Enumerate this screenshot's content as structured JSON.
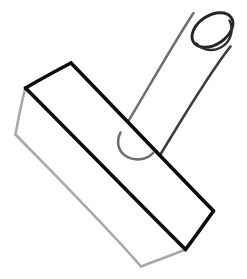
{
  "image": {
    "title": "Line drawing of a stamp-like 3D object",
    "subject": "rectangular prism with attached cylindrical handle",
    "style": "hand-drawn outline sketch",
    "width": 247,
    "height": 279,
    "background_color": "#ffffff"
  },
  "palette": {
    "background": "#ffffff",
    "stroke_black": "#0b0b0b",
    "stroke_dark_gray": "#434343",
    "stroke_mid_gray": "#6f6f6f",
    "stroke_light_gray": "#a8a8a8",
    "fill_white": "#ffffff"
  },
  "strokes": {
    "box_front_width": 3.6,
    "box_back_width": 2.6,
    "handle_width": 2.6,
    "handle_rim_width": 2.8
  },
  "geometry": {
    "box": {
      "name": "rectangular-prism",
      "top_face": {
        "points": "71,63 25,88 185,249 213,211",
        "description": "top visible face of the prism"
      },
      "front_edges": [
        {
          "name": "top-left-short-edge",
          "from": "71,63",
          "to": "25,88",
          "tone": "black"
        },
        {
          "name": "top-long-edge",
          "from": "71,63",
          "to": "213,211",
          "tone": "black"
        },
        {
          "name": "right-short-edge",
          "from": "213,211",
          "to": "185,249",
          "tone": "black"
        },
        {
          "name": "bottom-long-edge",
          "from": "25,88",
          "to": "185,249",
          "tone": "black"
        }
      ],
      "back_edges": [
        {
          "name": "left-vertical-edge",
          "from": "25,88",
          "to": "15,134",
          "tone": "light-gray"
        },
        {
          "name": "bottom-left-long-edge",
          "from": "15,134",
          "to": "141,266",
          "tone": "light-gray"
        },
        {
          "name": "bottom-short-edge",
          "from": "141,266",
          "to": "185,249",
          "tone": "light-gray"
        }
      ]
    },
    "handle": {
      "name": "cylindrical-handle",
      "axis": {
        "from": "139,143",
        "to": "214,29"
      },
      "radius_px": 22,
      "rim_ellipse": {
        "center": "213,29",
        "rx": 22,
        "ry": 14,
        "rotation_deg": -34,
        "description": "open top end of the cylinder"
      },
      "side_edges": [
        {
          "name": "handle-left-edge",
          "from": "124,128",
          "to": "194,14",
          "tone": "mid-gray"
        },
        {
          "name": "handle-right-edge",
          "from": "158,157",
          "to": "230,47",
          "tone": "dark-gray"
        }
      ],
      "bottom_cap": {
        "name": "handle-rounded-bottom",
        "description": "U-shaped rounded closed end",
        "tone": "mid-gray"
      }
    }
  },
  "labels": {
    "alt_text": "A black-and-white line drawing of a rubber stamp: a long rectangular block seen in perspective with a round cylindrical handle rising from its upper surface toward the top right.",
    "caption": ""
  }
}
